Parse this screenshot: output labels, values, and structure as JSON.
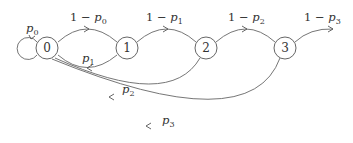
{
  "diagram": {
    "type": "markov-chain",
    "nodes": [
      {
        "id": "0",
        "label": "0"
      },
      {
        "id": "1",
        "label": "1"
      },
      {
        "id": "2",
        "label": "2"
      },
      {
        "id": "3",
        "label": "3"
      }
    ],
    "edges": [
      {
        "from": "0",
        "to": "0",
        "label_var": "p",
        "label_sub": "0",
        "label_prefix": ""
      },
      {
        "from": "0",
        "to": "1",
        "label_prefix": "1 − ",
        "label_var": "p",
        "label_sub": "0"
      },
      {
        "from": "1",
        "to": "2",
        "label_prefix": "1 − ",
        "label_var": "p",
        "label_sub": "1"
      },
      {
        "from": "2",
        "to": "3",
        "label_prefix": "1 − ",
        "label_var": "p",
        "label_sub": "2"
      },
      {
        "from": "3",
        "to": "out",
        "label_prefix": "1 − ",
        "label_var": "p",
        "label_sub": "3"
      },
      {
        "from": "1",
        "to": "0",
        "label_prefix": "",
        "label_var": "p",
        "label_sub": "1"
      },
      {
        "from": "2",
        "to": "0",
        "label_prefix": "",
        "label_var": "p",
        "label_sub": "2"
      },
      {
        "from": "3",
        "to": "0",
        "label_prefix": "",
        "label_var": "p",
        "label_sub": "3"
      }
    ]
  }
}
